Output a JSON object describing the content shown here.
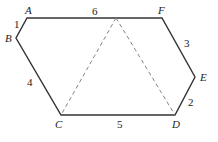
{
  "diagram": {
    "type": "hexagon",
    "vertices": [
      {
        "name": "A",
        "x": 27,
        "y": 18,
        "lx": 25,
        "ly": 14
      },
      {
        "name": "B",
        "x": 16,
        "y": 38,
        "lx": 5,
        "ly": 42
      },
      {
        "name": "C",
        "x": 61,
        "y": 115,
        "lx": 55,
        "ly": 128
      },
      {
        "name": "D",
        "x": 175,
        "y": 115,
        "lx": 172,
        "ly": 128
      },
      {
        "name": "E",
        "x": 195,
        "y": 77,
        "lx": 200,
        "ly": 81
      },
      {
        "name": "F",
        "x": 162,
        "y": 18,
        "lx": 158,
        "ly": 14
      }
    ],
    "apex": {
      "x": 116,
      "y": 18
    },
    "side_labels": [
      {
        "edge": "AB",
        "text": "1",
        "x": 14,
        "y": 28
      },
      {
        "edge": "AF",
        "text": "6",
        "x": 92,
        "y": 15
      },
      {
        "edge": "FE",
        "text": "3",
        "x": 184,
        "y": 47
      },
      {
        "edge": "ED",
        "text": "2",
        "x": 188,
        "y": 106
      },
      {
        "edge": "DC",
        "text": "5",
        "x": 117,
        "y": 128
      },
      {
        "edge": "CB",
        "text": "4",
        "x": 27,
        "y": 86
      }
    ],
    "colors": {
      "solid": "#333333",
      "dashed": "#777777"
    }
  }
}
